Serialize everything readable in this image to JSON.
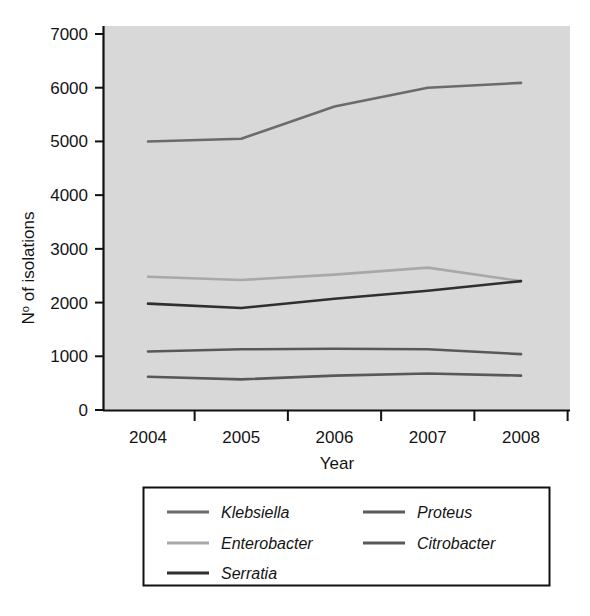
{
  "chart_data": {
    "type": "line",
    "title": "",
    "xlabel": "Year",
    "ylabel": "Nº of isolations",
    "categories": [
      "2004",
      "2005",
      "2006",
      "2007",
      "2008"
    ],
    "x": [
      2004,
      2005,
      2006,
      2007,
      2008
    ],
    "xlim": [
      2003.6,
      2008.4
    ],
    "ylim": [
      0,
      7000
    ],
    "ytick_labels": [
      "0",
      "1000",
      "2000",
      "3000",
      "4000",
      "5000",
      "6000",
      "7000"
    ],
    "ytick_values": [
      0,
      1000,
      2000,
      3000,
      4000,
      5000,
      6000,
      7000
    ],
    "xtick_labels": [
      "2004",
      "2005",
      "2006",
      "2007",
      "2008"
    ],
    "grid": false,
    "legend_position": "below-plot",
    "plot_background": "#d8d8d8",
    "series": [
      {
        "name": "Klebsiella",
        "color": "#6b6b6b",
        "values": [
          5000,
          5050,
          5650,
          6000,
          6090
        ]
      },
      {
        "name": "Proteus",
        "color": "#585858",
        "values": [
          1090,
          1130,
          1140,
          1130,
          1040
        ]
      },
      {
        "name": "Enterobacter",
        "color": "#a8a8a8",
        "values": [
          2480,
          2420,
          2520,
          2650,
          2400
        ]
      },
      {
        "name": "Citrobacter",
        "color": "#585858",
        "values": [
          620,
          570,
          640,
          680,
          640
        ]
      },
      {
        "name": "Serratia",
        "color": "#2f2f2f",
        "values": [
          1980,
          1900,
          2070,
          2220,
          2400
        ]
      }
    ]
  },
  "axes": {
    "ylabel_prefix": "N",
    "ylabel_superscript": "o",
    "ylabel_suffix": " of isolations",
    "xlabel": "Year"
  },
  "legend": {
    "entries": [
      {
        "label": "Klebsiella",
        "color": "#6b6b6b"
      },
      {
        "label": "Proteus",
        "color": "#585858"
      },
      {
        "label": "Enterobacter",
        "color": "#a8a8a8"
      },
      {
        "label": "Citrobacter",
        "color": "#585858"
      },
      {
        "label": "Serratia",
        "color": "#2f2f2f"
      }
    ]
  },
  "ticks": {
    "y": [
      {
        "label": "7000",
        "value": 7000
      },
      {
        "label": "6000",
        "value": 6000
      },
      {
        "label": "5000",
        "value": 5000
      },
      {
        "label": "4000",
        "value": 4000
      },
      {
        "label": "3000",
        "value": 3000
      },
      {
        "label": "2000",
        "value": 2000
      },
      {
        "label": "1000",
        "value": 1000
      },
      {
        "label": "0",
        "value": 0
      }
    ],
    "x": [
      {
        "label": "2004"
      },
      {
        "label": "2005"
      },
      {
        "label": "2006"
      },
      {
        "label": "2007"
      },
      {
        "label": "2008"
      }
    ]
  }
}
